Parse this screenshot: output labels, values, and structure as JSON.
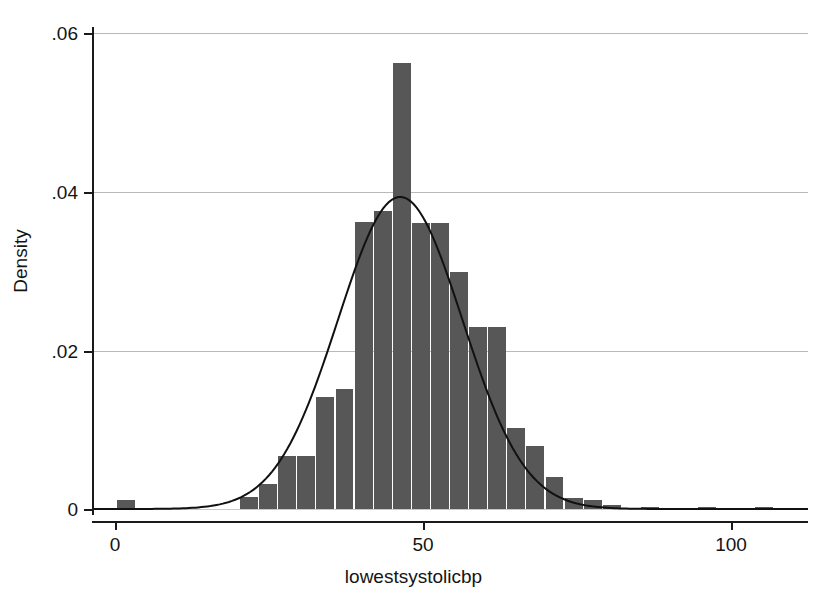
{
  "chart_data": {
    "type": "bar",
    "title": "",
    "xlabel": "lowestsystolicbp",
    "ylabel": "Density",
    "xlim": [
      -3.5,
      112.5
    ],
    "ylim": [
      0,
      0.0635
    ],
    "xticks": [
      0,
      50,
      100
    ],
    "xtick_labels": [
      "0",
      "50",
      "100"
    ],
    "yticks": [
      0,
      0.02,
      0.04,
      0.06
    ],
    "ytick_labels": [
      "0",
      ".02",
      ".04",
      ".06"
    ],
    "grid": "horizontal",
    "legend": "none",
    "bar_color": "#575757",
    "curve_color": "#111111",
    "bin_width": 3.1,
    "bin_starts": [
      0.3,
      20.3,
      23.4,
      26.5,
      29.6,
      32.7,
      35.8,
      38.9,
      42.0,
      45.1,
      48.2,
      51.3,
      54.4,
      57.5,
      60.6,
      63.7,
      66.8,
      69.9,
      73.0,
      76.1,
      79.2,
      85.4,
      94.7,
      103.9
    ],
    "values": [
      0.0011,
      0.0015,
      0.0032,
      0.0067,
      0.0067,
      0.0142,
      0.0152,
      0.0363,
      0.0377,
      0.0565,
      0.0362,
      0.0362,
      0.03,
      0.023,
      0.023,
      0.0103,
      0.008,
      0.004,
      0.0014,
      0.0012,
      0.0005,
      0.0003,
      0.0003,
      0.0003
    ],
    "overlay": {
      "name": "normal density",
      "type": "line",
      "mean": 46.3,
      "sd": 10.1,
      "peak_value": 0.0398
    }
  },
  "axes": {
    "x_axis_title": "lowestsystolicbp",
    "y_axis_title": "Density"
  }
}
